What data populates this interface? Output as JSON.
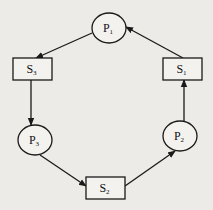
{
  "diagram": {
    "type": "cycle-graph",
    "colors": {
      "background": "#ecebe8",
      "stroke": "#1a1a1a",
      "fill": "#f3f2ef"
    },
    "nodes": [
      {
        "id": "P1",
        "shape": "ellipse",
        "letter": "P",
        "sub": "1"
      },
      {
        "id": "P2",
        "shape": "ellipse",
        "letter": "P",
        "sub": "2"
      },
      {
        "id": "P3",
        "shape": "ellipse",
        "letter": "P",
        "sub": "3"
      },
      {
        "id": "S1",
        "shape": "rect",
        "letter": "S",
        "sub": "1"
      },
      {
        "id": "S2",
        "shape": "rect",
        "letter": "S",
        "sub": "2"
      },
      {
        "id": "S3",
        "shape": "rect",
        "letter": "S",
        "sub": "3"
      }
    ],
    "edges": [
      {
        "from": "P1",
        "to": "S3"
      },
      {
        "from": "S3",
        "to": "P3"
      },
      {
        "from": "P3",
        "to": "S2"
      },
      {
        "from": "S2",
        "to": "P2"
      },
      {
        "from": "P2",
        "to": "S1"
      },
      {
        "from": "S1",
        "to": "P1"
      }
    ]
  }
}
